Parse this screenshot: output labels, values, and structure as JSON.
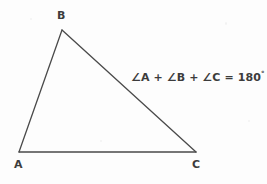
{
  "figure": {
    "type": "geometry-diagram",
    "background_color": "#fdfdfd",
    "stroke_color": "#4a4a4a",
    "text_color": "#3c3c3c"
  },
  "vertices": {
    "a": {
      "label": "A",
      "x": 19,
      "y": 152
    },
    "b": {
      "label": "B",
      "x": 62,
      "y": 30
    },
    "c": {
      "label": "C",
      "x": 196,
      "y": 152
    }
  },
  "annotation": {
    "formula_prefix": "∠A + ∠B + ∠C = 180",
    "degree_symbol": "°",
    "full_text": "∠A + ∠B + ∠C = 180°"
  },
  "chart_data": {
    "type": "scatter",
    "xlabel": "",
    "ylabel": "",
    "categories": [
      "A",
      "B",
      "C"
    ],
    "points": [
      {
        "name": "A",
        "x": 19,
        "y": 152
      },
      {
        "name": "B",
        "x": 62,
        "y": 30
      },
      {
        "name": "C",
        "x": 196,
        "y": 152
      }
    ],
    "edges": [
      {
        "from": "A",
        "to": "B"
      },
      {
        "from": "B",
        "to": "C"
      },
      {
        "from": "C",
        "to": "A"
      }
    ],
    "annotations": [
      "∠A + ∠B + ∠C = 180°"
    ],
    "grid": false,
    "legend": "none"
  }
}
